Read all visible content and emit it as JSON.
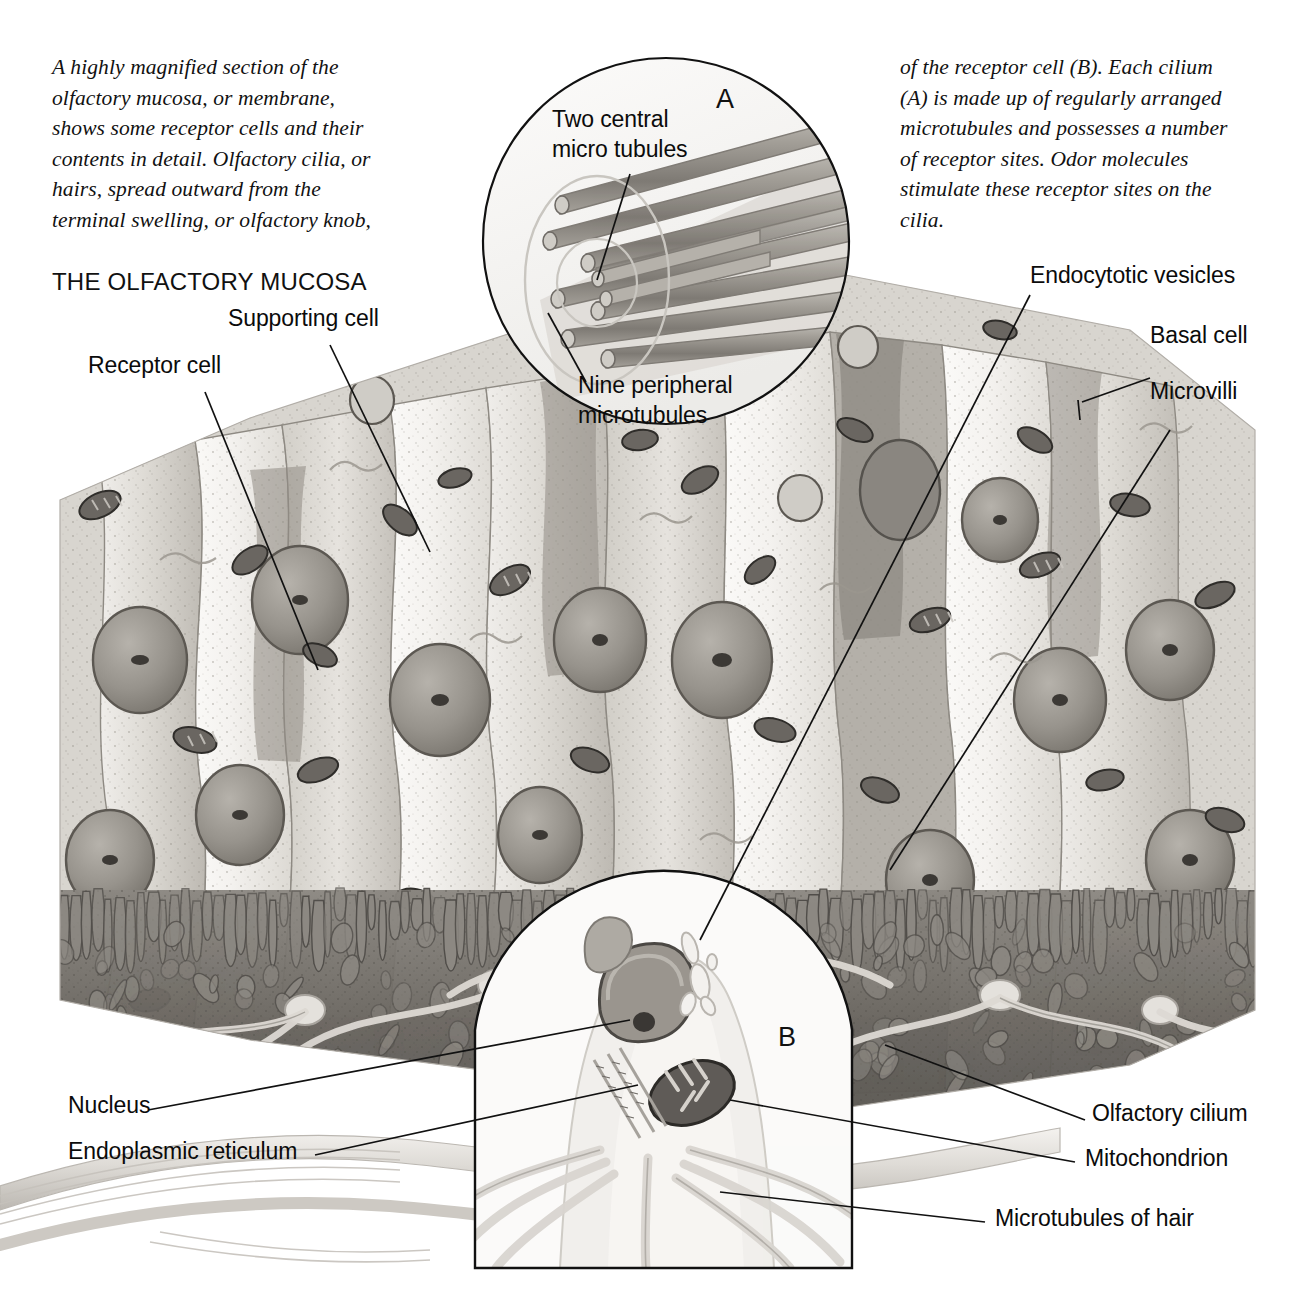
{
  "figure": {
    "title": "THE OLFACTORY MUCOSA",
    "intro_left": "A highly magnified section of the\nolfactory mucosa, or membrane,\nshows some receptor cells and their\ncontents in detail. Olfactory cilia, or\nhairs, spread outward from the\nterminal swelling, or olfactory knob,",
    "intro_right": "of the receptor cell (B). Each cilium\n(A) is made up of regularly arranged\nmicrotubules and possesses a number\nof receptor sites. Odor molecules\nstimulate these receptor sites on the\ncilia."
  },
  "insets": {
    "a": {
      "letter": "A",
      "label_central": "Two central\nmicro tubules",
      "label_peripheral": "Nine peripheral\nmicrotubules"
    },
    "b": {
      "letter": "B"
    }
  },
  "labels": {
    "supporting_cell": "Supporting cell",
    "receptor_cell": "Receptor cell",
    "endocytotic_vesicles": "Endocytotic vesicles",
    "basal_cell": "Basal cell",
    "microvilli": "Microvilli",
    "nucleus": "Nucleus",
    "endoplasmic_reticulum": "Endoplasmic reticulum",
    "olfactory_cilium": "Olfactory cilium",
    "mitochondrion": "Mitochondrion",
    "microtubules_of_hair": "Microtubules  of hair"
  },
  "colors": {
    "ink": "#111111",
    "page": "#ffffff",
    "cell_light": "#e9e7e3",
    "cell_mid": "#c9c6c0",
    "cell_dark": "#9a968f",
    "nucleus": "#8e8a84",
    "mucus_dark": "#6f6b66",
    "organelle": "#4a4743"
  }
}
